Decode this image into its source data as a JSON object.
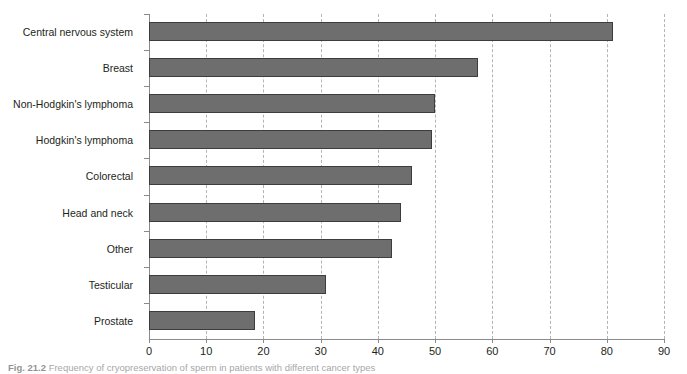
{
  "figure": {
    "caption_label": "Fig. 21.2",
    "caption_text": "Frequency of cryopreservation of sperm in patients with different cancer types"
  },
  "chart_data": {
    "type": "bar",
    "orientation": "horizontal",
    "title": "",
    "subtitle": "",
    "xlabel": "",
    "ylabel": "",
    "xlim": [
      0,
      90
    ],
    "ylim": null,
    "xticks": [
      0,
      10,
      20,
      30,
      40,
      50,
      60,
      70,
      80,
      90
    ],
    "grid": "vertical-dashed",
    "legend": "none",
    "categories": [
      "Central nervous system",
      "Breast",
      "Non-Hodgkin's lymphoma",
      "Hodgkin's lymphoma",
      "Colorectal",
      "Head and neck",
      "Other",
      "Testicular",
      "Prostate"
    ],
    "values": [
      81,
      57.5,
      50,
      49.5,
      46,
      44,
      42.5,
      31,
      18.5
    ],
    "colors": {
      "bar_fill": "#6e6e6e",
      "bar_border": "#3d3d3d",
      "gridline": "#b4b4b4",
      "axis": "#8a8a8a",
      "text": "#231f20"
    }
  }
}
